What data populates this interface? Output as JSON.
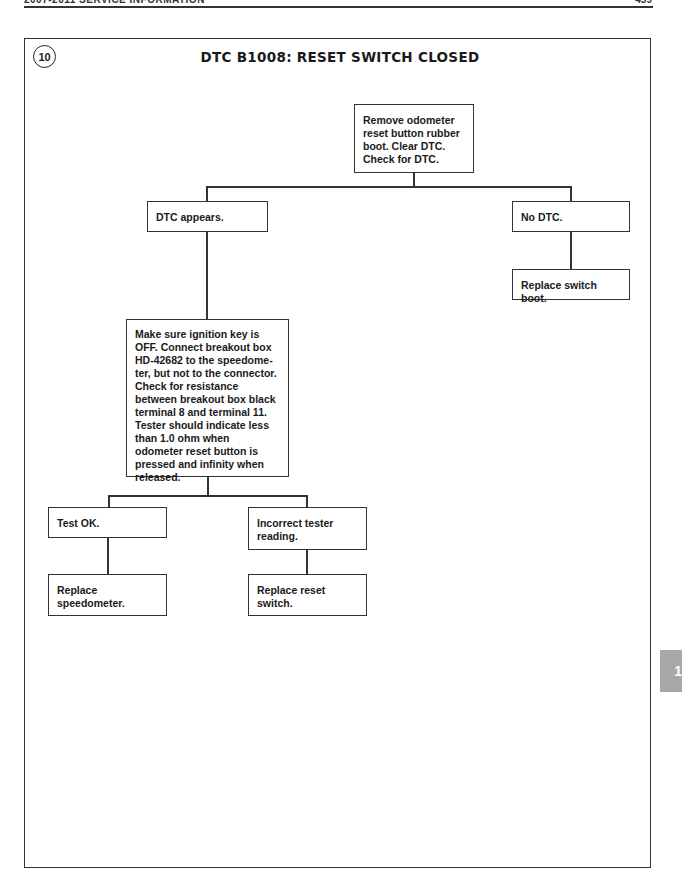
{
  "header": {
    "running_title": "2007-2011 SERVICE INFORMATION",
    "page_number": "459"
  },
  "procedure": {
    "step_number": "10",
    "title": "DTC B1008: RESET SWITCH CLOSED"
  },
  "flowchart": {
    "start": "Remove odometer reset button rubber boot. Clear DTC. Check for DTC.",
    "branch_yes": "DTC appears.",
    "branch_no": "No DTC.",
    "no_action": "Replace switch boot.",
    "test_step": "Make sure ignition key is OFF. Connect breakout box HD-42682 to the speedome-ter, but not to the connector. Check for resistance between breakout box black terminal 8 and terminal 11. Tester should indicate less than 1.0 ohm when odometer reset button is pressed and infinity when released.",
    "test_ok": "Test OK.",
    "test_ok_action": "Replace speedometer.",
    "test_bad": "Incorrect tester reading.",
    "test_bad_action": "Replace reset switch."
  },
  "side_tab": {
    "label": "1",
    "color": "#a8a8a8"
  }
}
